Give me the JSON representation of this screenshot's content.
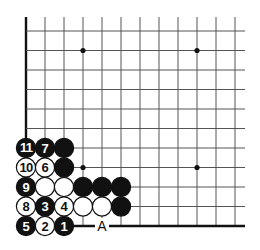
{
  "diagram": {
    "type": "go-board-corner",
    "colors": {
      "line": "#555555",
      "edge": "#111111",
      "black": "#111111",
      "white": "#ffffff",
      "background": "#ffffff"
    },
    "grid": {
      "cols": 12,
      "rows": 11,
      "x0": 26,
      "dx": 19.0,
      "y0": 31,
      "dy": 19.5,
      "top_open_extend": 14,
      "right_open_extend": 10,
      "left_edge": true,
      "bottom_edge": true
    },
    "star_points": [
      {
        "col": 3,
        "row": 1
      },
      {
        "col": 9,
        "row": 1
      },
      {
        "col": 3,
        "row": 7
      },
      {
        "col": 9,
        "row": 7
      }
    ],
    "stones": [
      {
        "col": 0,
        "row": 6,
        "color": "black",
        "label": "11"
      },
      {
        "col": 1,
        "row": 6,
        "color": "black",
        "label": "7"
      },
      {
        "col": 2,
        "row": 6,
        "color": "black",
        "label": ""
      },
      {
        "col": 0,
        "row": 7,
        "color": "white",
        "label": "10"
      },
      {
        "col": 1,
        "row": 7,
        "color": "white",
        "label": "6"
      },
      {
        "col": 2,
        "row": 7,
        "color": "black",
        "label": ""
      },
      {
        "col": 0,
        "row": 8,
        "color": "black",
        "label": "9"
      },
      {
        "col": 1,
        "row": 8,
        "color": "white",
        "label": ""
      },
      {
        "col": 2,
        "row": 8,
        "color": "white",
        "label": ""
      },
      {
        "col": 3,
        "row": 8,
        "color": "black",
        "label": ""
      },
      {
        "col": 4,
        "row": 8,
        "color": "black",
        "label": ""
      },
      {
        "col": 5,
        "row": 8,
        "color": "black",
        "label": ""
      },
      {
        "col": 0,
        "row": 9,
        "color": "white",
        "label": "8"
      },
      {
        "col": 1,
        "row": 9,
        "color": "black",
        "label": "3"
      },
      {
        "col": 2,
        "row": 9,
        "color": "white",
        "label": "4"
      },
      {
        "col": 3,
        "row": 9,
        "color": "white",
        "label": ""
      },
      {
        "col": 4,
        "row": 9,
        "color": "white",
        "label": ""
      },
      {
        "col": 5,
        "row": 9,
        "color": "black",
        "label": ""
      },
      {
        "col": 0,
        "row": 10,
        "color": "black",
        "label": "5"
      },
      {
        "col": 1,
        "row": 10,
        "color": "white",
        "label": "2"
      },
      {
        "col": 2,
        "row": 10,
        "color": "black",
        "label": "1"
      }
    ],
    "marks": [
      {
        "col": 4,
        "row": 10,
        "label": "A"
      }
    ]
  }
}
